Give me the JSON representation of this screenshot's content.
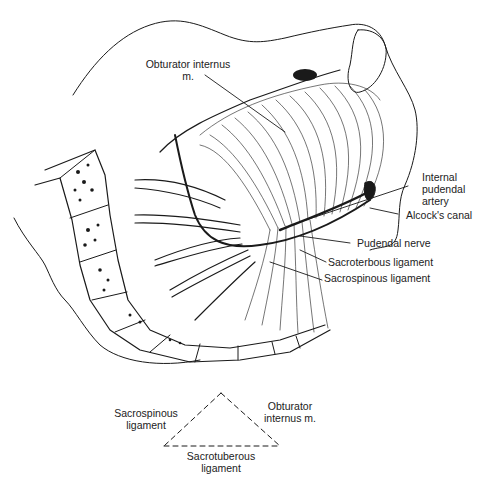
{
  "figure": {
    "type": "anatomical-illustration",
    "labels": {
      "obturator_internus_line1": "Obturator internus",
      "obturator_internus_line2": "m.",
      "internal_pudendal_line1": "Internal",
      "internal_pudendal_line2": "pudendal",
      "internal_pudendal_line3": "artery",
      "alcocks_canal": "Alcock's canal",
      "pudendal_nerve": "Pudendal nerve",
      "sacroterbous_ligament": "Sacroterbous ligament",
      "sacrospinous_ligament": "Sacrospinous ligament"
    },
    "colors": {
      "ink": "#1a1a1a",
      "background": "#ffffff"
    }
  },
  "schematic": {
    "shape": "dashed-triangle",
    "left_line1": "Sacrospinous",
    "left_line2": "ligament",
    "right_line1": "Obturator",
    "right_line2": "internus m.",
    "bottom_line1": "Sacrotuberous",
    "bottom_line2": "ligament"
  }
}
